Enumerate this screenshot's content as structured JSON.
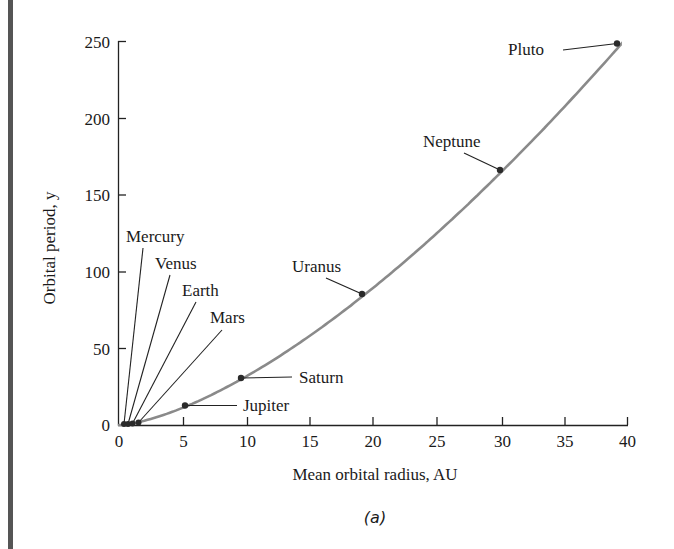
{
  "chart_data": {
    "type": "line",
    "title": "",
    "caption": "(a)",
    "xlabel": "Mean orbital radius, AU",
    "ylabel": "Orbital period, y",
    "xlim": [
      0,
      40
    ],
    "ylim": [
      0,
      250
    ],
    "xticks": [
      0,
      5,
      10,
      15,
      20,
      25,
      30,
      35,
      40
    ],
    "yticks": [
      0,
      50,
      100,
      150,
      200,
      250
    ],
    "grid": false,
    "legend": null,
    "curve": {
      "description": "T = a^1.5 (Kepler's third law)",
      "color": "#888888"
    },
    "points": [
      {
        "name": "Mercury",
        "x": 0.39,
        "y": 0.24
      },
      {
        "name": "Venus",
        "x": 0.72,
        "y": 0.62
      },
      {
        "name": "Earth",
        "x": 1.0,
        "y": 1.0
      },
      {
        "name": "Mars",
        "x": 1.52,
        "y": 1.88
      },
      {
        "name": "Jupiter",
        "x": 5.2,
        "y": 11.9
      },
      {
        "name": "Saturn",
        "x": 9.5,
        "y": 29.5
      },
      {
        "name": "Uranus",
        "x": 19.2,
        "y": 84.0
      },
      {
        "name": "Neptune",
        "x": 30.1,
        "y": 164.8
      },
      {
        "name": "Pluto",
        "x": 39.5,
        "y": 248.1
      }
    ]
  },
  "labels": {
    "mercury": "Mercury",
    "venus": "Venus",
    "earth": "Earth",
    "mars": "Mars",
    "jupiter": "Jupiter",
    "saturn": "Saturn",
    "uranus": "Uranus",
    "neptune": "Neptune",
    "pluto": "Pluto"
  },
  "axes": {
    "xlabel": "Mean orbital radius, AU",
    "ylabel": "Orbital period, y",
    "caption": "(a)",
    "xtick_labels": [
      "0",
      "5",
      "10",
      "15",
      "20",
      "25",
      "30",
      "35",
      "40"
    ],
    "ytick_labels": [
      "0",
      "50",
      "100",
      "150",
      "200",
      "250"
    ]
  }
}
